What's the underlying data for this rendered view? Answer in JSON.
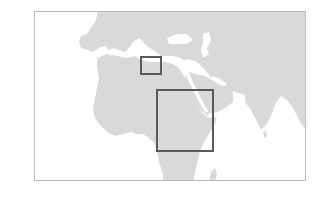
{
  "map": {
    "region_shown": "Africa, Europe, Middle East and South Asia",
    "colors": {
      "background": "#ffffff",
      "land": "#d9d9d9",
      "water": "#ffffff",
      "frame_border": "#bdbdbd",
      "highlight_border": "#5a5a5a"
    },
    "frame": {
      "x": 34,
      "y": 11,
      "width": 272,
      "height": 170
    },
    "highlight_boxes": [
      {
        "id": "small-box",
        "label": "Northeast Africa / Eastern Mediterranean area",
        "x": 140,
        "y": 56,
        "width": 22,
        "height": 19
      },
      {
        "id": "large-box",
        "label": "Horn of Africa / East Africa area",
        "x": 156,
        "y": 89,
        "width": 58,
        "height": 63
      }
    ]
  }
}
